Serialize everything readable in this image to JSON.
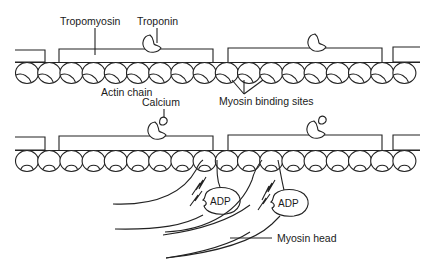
{
  "diagram": {
    "labels": {
      "tropomyosin": "Tropomyosin",
      "troponin": "Troponin",
      "actin_chain": "Actin chain",
      "myosin_binding_sites": "Myosin binding sites",
      "calcium": "Calcium",
      "adp_1": "ADP",
      "adp_2": "ADP",
      "myosin_head": "Myosin head"
    },
    "panels": [
      {
        "name": "relaxed",
        "description": "Tropomyosin covers myosin binding sites on actin chain; troponin attached"
      },
      {
        "name": "contracting",
        "description": "Calcium binds troponin, binding sites exposed, myosin heads with ADP attach to actin"
      }
    ],
    "colors": {
      "line": "#222222",
      "background": "#ffffff"
    }
  }
}
